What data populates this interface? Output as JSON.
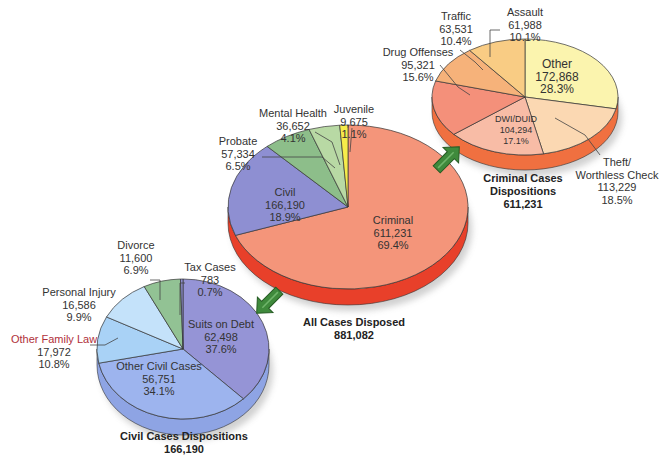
{
  "chart_data": [
    {
      "type": "pie",
      "title": "All Cases Disposed",
      "total": "881,082",
      "slices": [
        {
          "label": "Criminal",
          "value": 611231,
          "value_text": "611,231",
          "pct": "69.4%",
          "color": "#f4957a"
        },
        {
          "label": "Civil",
          "value": 166190,
          "value_text": "166,190",
          "pct": "18.9%",
          "color": "#8e8fd2"
        },
        {
          "label": "Probate",
          "value": 57334,
          "value_text": "57,334",
          "pct": "6.5%",
          "color": "#8dbe8a"
        },
        {
          "label": "Mental Health",
          "value": 36652,
          "value_text": "36,652",
          "pct": "4.1%",
          "color": "#b8d9a4"
        },
        {
          "label": "Juvenile",
          "value": 9675,
          "value_text": "9,675",
          "pct": "1.1%",
          "color": "#f6ec4a"
        }
      ]
    },
    {
      "type": "pie",
      "title": "Criminal Cases Dispositions",
      "total": "611,231",
      "slices": [
        {
          "label": "Other",
          "value": 172868,
          "value_text": "172,868",
          "pct": "28.3%",
          "color": "#fbf4ae"
        },
        {
          "label": "Theft/ Worthless Check",
          "value": 113229,
          "value_text": "113,229",
          "pct": "18.5%",
          "color": "#fbd8b2"
        },
        {
          "label": "DWI/DUID",
          "value": 104294,
          "value_text": "104,294",
          "pct": "17.1%",
          "color": "#f8bca6"
        },
        {
          "label": "Drug Offenses",
          "value": 95321,
          "value_text": "95,321",
          "pct": "15.6%",
          "color": "#f4907a"
        },
        {
          "label": "Traffic",
          "value": 63531,
          "value_text": "63,531",
          "pct": "10.4%",
          "color": "#f6b27a"
        },
        {
          "label": "Assault",
          "value": 61988,
          "value_text": "61,988",
          "pct": "10.1%",
          "color": "#f9cc84"
        }
      ]
    },
    {
      "type": "pie",
      "title": "Civil Cases Dispositions",
      "total": "166,190",
      "slices": [
        {
          "label": "Suits on Debt",
          "value": 62498,
          "value_text": "62,498",
          "pct": "37.6%",
          "color": "#9594d6"
        },
        {
          "label": "Other Civil Cases",
          "value": 56751,
          "value_text": "56,751",
          "pct": "34.1%",
          "color": "#9db4ee"
        },
        {
          "label": "Other Family Law",
          "value": 17972,
          "value_text": "17,972",
          "pct": "10.8%",
          "color": "#a9d2f6"
        },
        {
          "label": "Personal Injury",
          "value": 16586,
          "value_text": "16,586",
          "pct": "9.9%",
          "color": "#c4e2fa"
        },
        {
          "label": "Divorce",
          "value": 11600,
          "value_text": "11,600",
          "pct": "6.9%",
          "color": "#92c294"
        },
        {
          "label": "Tax Cases",
          "value": 783,
          "value_text": "783",
          "pct": "0.7%",
          "color": "#8e8fd2"
        }
      ]
    }
  ],
  "labels": {
    "main": {
      "criminal": {
        "name": "Criminal",
        "value": "611,231",
        "pct": "69.4%"
      },
      "civil": {
        "name": "Civil",
        "value": "166,190",
        "pct": "18.9%"
      },
      "probate": {
        "name": "Probate",
        "value": "57,334",
        "pct": "6.5%"
      },
      "mental_health": {
        "name": "Mental Health",
        "value": "36,652",
        "pct": "4.1%"
      },
      "juvenile": {
        "name": "Juvenile",
        "value": "9,675",
        "pct": "1.1%"
      },
      "caption": {
        "title": "All Cases Disposed",
        "total": "881,082"
      }
    },
    "criminal": {
      "other": {
        "name": "Other",
        "value": "172,868",
        "pct": "28.3%"
      },
      "theft": {
        "name1": "Theft/",
        "name2": "Worthless Check",
        "value": "113,229",
        "pct": "18.5%"
      },
      "dwi": {
        "name": "DWI/DUID",
        "value": "104,294",
        "pct": "17.1%"
      },
      "drug": {
        "name": "Drug Offenses",
        "value": "95,321",
        "pct": "15.6%"
      },
      "traffic": {
        "name": "Traffic",
        "value": "63,531",
        "pct": "10.4%"
      },
      "assault": {
        "name": "Assault",
        "value": "61,988",
        "pct": "10.1%"
      },
      "caption": {
        "title1": "Criminal Cases",
        "title2": "Dispositions",
        "total": "611,231"
      }
    },
    "civil": {
      "suits": {
        "name": "Suits on Debt",
        "value": "62,498",
        "pct": "37.6%"
      },
      "other_civil": {
        "name": "Other Civil Cases",
        "value": "56,751",
        "pct": "34.1%"
      },
      "family": {
        "name": "Other Family Law",
        "value": "17,972",
        "pct": "10.8%"
      },
      "injury": {
        "name": "Personal Injury",
        "value": "16,586",
        "pct": "9.9%"
      },
      "divorce": {
        "name": "Divorce",
        "value": "11,600",
        "pct": "6.9%"
      },
      "tax": {
        "name": "Tax Cases",
        "value": "783",
        "pct": "0.7%"
      },
      "caption": {
        "title": "Civil Cases Dispositions",
        "total": "166,190"
      }
    }
  },
  "colors": {
    "arrow": "#3f8a3c",
    "arrow_dark": "#2a6128",
    "main_side": "#e8402a",
    "criminal_side": "#f07040",
    "civil_side": "#8ea4e4",
    "leader": "#444444"
  }
}
